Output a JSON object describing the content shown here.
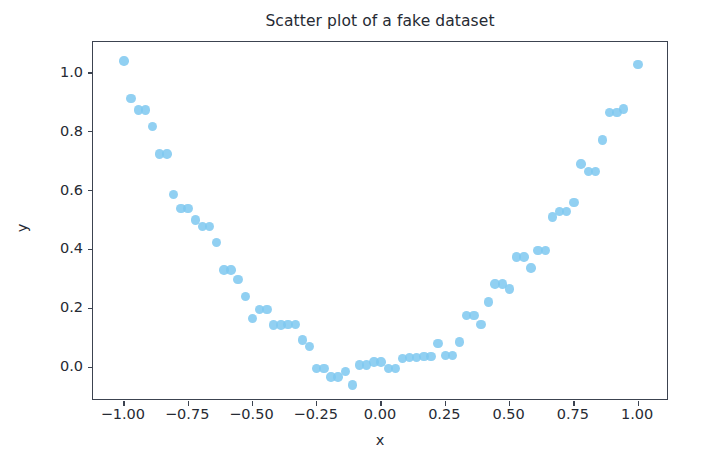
{
  "chart_data": {
    "type": "scatter",
    "title": "Scatter plot of a fake dataset",
    "xlabel": "x",
    "ylabel": "y",
    "xlim": [
      -1.12,
      1.12
    ],
    "ylim": [
      -0.115,
      1.105
    ],
    "grid": false,
    "legend": null,
    "marker": {
      "color": "#7ec8f0",
      "size_px": 9.4,
      "opacity": 0.85,
      "shape": "circle"
    },
    "axes": {
      "frame_color": "#3c4350",
      "xticks": [
        -1.0,
        -0.75,
        -0.5,
        -0.25,
        0.0,
        0.25,
        0.5,
        0.75,
        1.0
      ],
      "xtick_labels": [
        "−1.00",
        "−0.75",
        "−0.50",
        "−0.25",
        "0.00",
        "0.25",
        "0.50",
        "0.75",
        "1.00"
      ],
      "yticks": [
        0.0,
        0.2,
        0.4,
        0.6,
        0.8,
        1.0
      ],
      "ytick_labels": [
        "0.0",
        "0.2",
        "0.4",
        "0.6",
        "0.8",
        "1.0"
      ]
    },
    "x": [
      -1.0,
      -0.972,
      -0.944,
      -0.917,
      -0.889,
      -0.861,
      -0.833,
      -0.806,
      -0.778,
      -0.75,
      -0.722,
      -0.694,
      -0.667,
      -0.639,
      -0.611,
      -0.583,
      -0.556,
      -0.528,
      -0.5,
      -0.472,
      -0.444,
      -0.417,
      -0.389,
      -0.361,
      -0.333,
      -0.306,
      -0.278,
      -0.25,
      -0.222,
      -0.194,
      -0.167,
      -0.139,
      -0.111,
      -0.083,
      -0.056,
      -0.028,
      0.0,
      0.028,
      0.056,
      0.083,
      0.111,
      0.139,
      0.167,
      0.194,
      0.222,
      0.25,
      0.278,
      0.306,
      0.333,
      0.361,
      0.389,
      0.417,
      0.444,
      0.472,
      0.5,
      0.528,
      0.556,
      0.583,
      0.611,
      0.639,
      0.667,
      0.694,
      0.722,
      0.75,
      0.778,
      0.806,
      0.833,
      0.861,
      0.889,
      0.917,
      0.944,
      1.0
    ],
    "y": [
      1.04,
      0.912,
      0.874,
      0.874,
      0.817,
      0.725,
      0.725,
      0.586,
      0.54,
      0.54,
      0.5,
      0.478,
      0.478,
      0.424,
      0.33,
      0.33,
      0.297,
      0.24,
      0.165,
      0.196,
      0.196,
      0.143,
      0.143,
      0.145,
      0.145,
      0.092,
      0.07,
      -0.005,
      -0.005,
      -0.034,
      -0.034,
      -0.014,
      -0.061,
      0.008,
      0.008,
      0.018,
      0.018,
      -0.004,
      -0.004,
      0.03,
      0.033,
      0.033,
      0.037,
      0.037,
      0.08,
      0.04,
      0.04,
      0.086,
      0.176,
      0.176,
      0.145,
      0.222,
      0.282,
      0.282,
      0.265,
      0.375,
      0.375,
      0.337,
      0.396,
      0.396,
      0.51,
      0.528,
      0.528,
      0.56,
      0.69,
      0.665,
      0.665,
      0.772,
      0.866,
      0.866,
      0.878,
      1.028
    ]
  }
}
